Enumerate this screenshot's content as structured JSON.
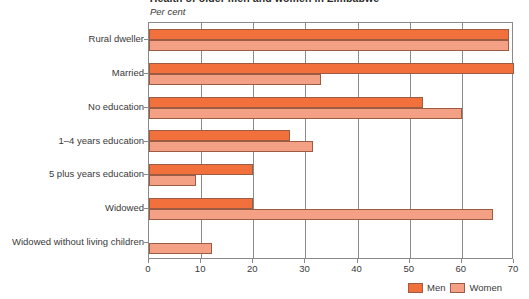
{
  "chart_data": {
    "type": "bar",
    "orientation": "horizontal",
    "title": "Health of older men and women in Zimbabwe",
    "subtitle": "",
    "xlabel": "Per cent",
    "ylabel": "",
    "xlim": [
      0,
      70
    ],
    "xticks": [
      0,
      10,
      20,
      30,
      40,
      50,
      60,
      70
    ],
    "xtick_labels": [
      "0",
      "10",
      "20",
      "30",
      "40",
      "50",
      "60",
      "70"
    ],
    "grid": true,
    "grid_axis": "x",
    "legend_position": "bottom-right",
    "categories": [
      "Rural dweller",
      "Married",
      "No education",
      "1–4 years education",
      "5 plus years education",
      "Widowed",
      "Widowed without living children"
    ],
    "series": [
      {
        "name": "Men",
        "color": "#F1703C",
        "values": [
          69,
          70,
          52.5,
          27,
          20,
          20,
          0
        ]
      },
      {
        "name": "Women",
        "color": "#F4A085",
        "values": [
          69,
          33,
          60,
          31.5,
          9,
          66,
          12
        ]
      }
    ]
  },
  "colors": {
    "men": "#F1703C",
    "women": "#F4A085",
    "bar_border": "#9c5c44",
    "axis": "#8a8a8a",
    "text": "#3a3a3a",
    "background": "#ffffff"
  },
  "legend": {
    "items": [
      {
        "label": "Men",
        "swatch": "men"
      },
      {
        "label": "Women",
        "swatch": "women"
      }
    ]
  }
}
